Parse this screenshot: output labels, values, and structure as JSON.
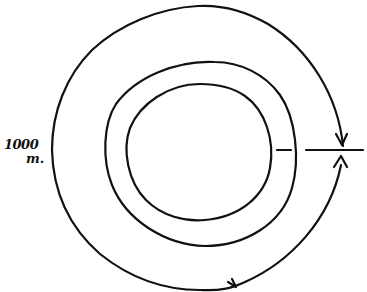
{
  "diagram": {
    "type": "contour-map sketch",
    "contour_label": {
      "value": "1000",
      "unit": "m."
    },
    "contours": [
      {
        "name": "outer",
        "note": "contour line with arrows indicating path direction"
      },
      {
        "name": "middle"
      },
      {
        "name": "inner"
      }
    ],
    "markers": [
      {
        "name": "short-tick",
        "description": "short horizontal dash between inner and middle contour (right side)"
      },
      {
        "name": "cross-line",
        "description": "horizontal line crossing the outer contour on right, with opposing arrows"
      }
    ],
    "colors": {
      "ink": "#111111",
      "paper": "#ffffff"
    }
  }
}
